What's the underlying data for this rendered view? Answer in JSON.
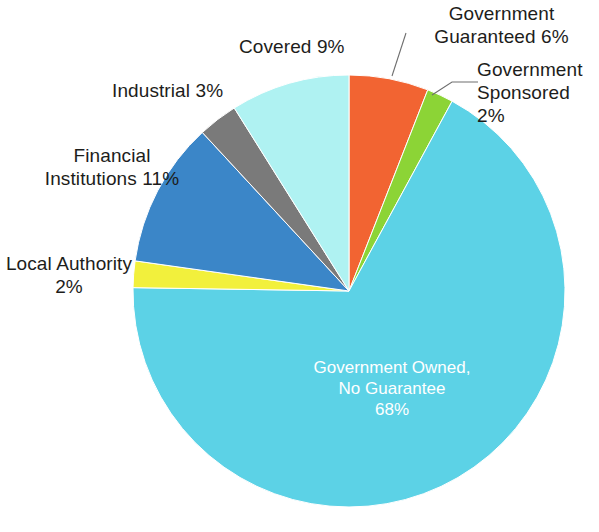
{
  "chart_data": {
    "type": "pie",
    "title": "",
    "subtitle": "",
    "xlabel": "",
    "ylabel": "",
    "legend_position": "none",
    "grid": false,
    "units": "percent",
    "total": 101,
    "start_angle_deg": 0,
    "direction": "clockwise",
    "categories": [
      "Government Guaranteed",
      "Government Sponsored",
      "Government Owned, No Guarantee",
      "Local Authority",
      "Financial Institutions",
      "Industrial",
      "Covered"
    ],
    "values": [
      6,
      2,
      68,
      2,
      11,
      3,
      9
    ],
    "colors": [
      "#f26432",
      "#8cd436",
      "#5cd2e6",
      "#f2f03c",
      "#3b86c8",
      "#7a7a7a",
      "#aff2f2"
    ],
    "slices": [
      {
        "name": "Government Guaranteed",
        "value": 6,
        "value_text": "6%",
        "label": "Government\nGuaranteed 6%",
        "color": "#f26432",
        "label_placement": "outside",
        "has_leader_line": true
      },
      {
        "name": "Government Sponsored",
        "value": 2,
        "value_text": "2%",
        "label": "Government\nSponsored 2%",
        "color": "#8cd436",
        "label_placement": "outside",
        "has_leader_line": true
      },
      {
        "name": "Government Owned, No Guarantee",
        "value": 68,
        "value_text": "68%",
        "label": "Government Owned,\nNo Guarantee\n68%",
        "color": "#5cd2e6",
        "label_placement": "inside",
        "has_leader_line": false
      },
      {
        "name": "Local Authority",
        "value": 2,
        "value_text": "2%",
        "label": "Local Authority\n2%",
        "color": "#f2f03c",
        "label_placement": "outside",
        "has_leader_line": false
      },
      {
        "name": "Financial Institutions",
        "value": 11,
        "value_text": "11%",
        "label": "Financial\nInstitutions 11%",
        "color": "#3b86c8",
        "label_placement": "outside",
        "has_leader_line": false
      },
      {
        "name": "Industrial",
        "value": 3,
        "value_text": "3%",
        "label": "Industrial 3%",
        "color": "#7a7a7a",
        "label_placement": "outside",
        "has_leader_line": false
      },
      {
        "name": "Covered",
        "value": 9,
        "value_text": "9%",
        "label": "Covered 9%",
        "color": "#aff2f2",
        "label_placement": "outside",
        "has_leader_line": false
      }
    ]
  },
  "labels": {
    "government_guaranteed": "Government\nGuaranteed 6%",
    "government_sponsored": "Government\nSponsored 2%",
    "covered": "Covered 9%",
    "industrial": "Industrial 3%",
    "financial_institutions": "Financial\nInstitutions 11%",
    "local_authority": "Local Authority\n2%",
    "government_owned": "Government Owned,\nNo Guarantee\n68%"
  },
  "style": {
    "background": "#ffffff",
    "label_color": "#1d1d1b",
    "inside_label_color": "#ffffff",
    "leader_line_color": "#6e6e6e"
  }
}
